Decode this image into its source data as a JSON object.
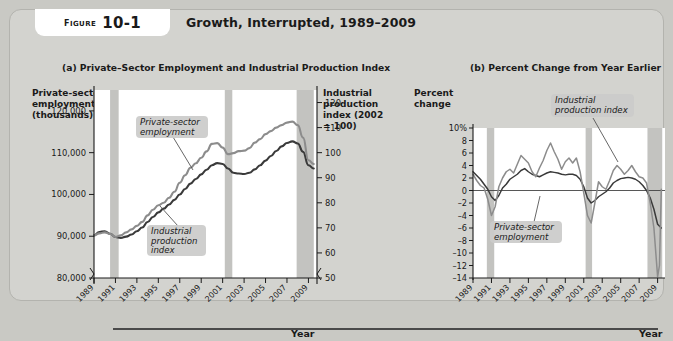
{
  "figure": {
    "label_word": "FIGURE",
    "number": "10-1",
    "title": "Growth, Interrupted, 1989–2009"
  },
  "colors": {
    "card_bg": "#d3d3cf",
    "page_bg": "#c9c9c4",
    "plot_bg": "#ffffff",
    "recession_band": "#c3c3c0",
    "employment_series": "#3a3a3a",
    "industrial_series": "#8c8c8c"
  },
  "panel_a": {
    "title": "(a) Private–Sector Employment and Industrial Production Index",
    "y_left_title": "Private-sector\nemployment\n(thousands)",
    "y_left_title_lines": [
      "Private-sector",
      "employment",
      "(thousands)"
    ],
    "y_right_title_lines": [
      "Industrial",
      "production",
      "index (2002",
      "= 100)"
    ],
    "x_title": "Year",
    "callouts": [
      {
        "name": "private-sector-employment",
        "lines": [
          "Private-sector",
          "employment"
        ]
      },
      {
        "name": "industrial-production-index",
        "lines": [
          "Industrial",
          "production",
          "index"
        ]
      }
    ]
  },
  "panel_b": {
    "title": "(b) Percent Change from Year Earlier",
    "y_title_lines": [
      "Percent",
      "change"
    ],
    "x_title": "Year",
    "callouts": [
      {
        "name": "industrial-production-index",
        "lines": [
          "Industrial",
          "production index"
        ]
      },
      {
        "name": "private-sector-employment",
        "lines": [
          "Private-sector",
          "employment"
        ]
      }
    ]
  },
  "chart_data": [
    {
      "type": "line",
      "name": "panel-a",
      "title": "(a) Private–Sector Employment and Industrial Production Index",
      "xlabel": "Year",
      "ylabel": "Private-sector employment (thousands)",
      "ylabel_right": "Industrial production index (2002 = 100)",
      "xlim": [
        1989,
        2009.8
      ],
      "ylim": [
        80000,
        125000
      ],
      "ylim_right": [
        50,
        125
      ],
      "grid": false,
      "axis_break_left": true,
      "axis_break_right": true,
      "yticks": [
        80000,
        90000,
        100000,
        110000,
        120000
      ],
      "ytick_labels": [
        "80,000",
        "90,000",
        "100,000",
        "110,000",
        "120,000"
      ],
      "yticks_right": [
        50,
        60,
        70,
        80,
        90,
        100,
        110,
        120
      ],
      "ytick_labels_right": [
        "50",
        "60",
        "70",
        "80",
        "90",
        "100",
        "110",
        "120"
      ],
      "xticks": [
        1989,
        1991,
        1993,
        1995,
        1997,
        1999,
        2001,
        2003,
        2005,
        2007,
        2009
      ],
      "xtick_labels": [
        "1989",
        "1991",
        "1993",
        "1995",
        "1997",
        "1999",
        "2001",
        "2003",
        "2005",
        "2007",
        "2009"
      ],
      "recessions": [
        [
          1990.5,
          1991.3
        ],
        [
          2001.2,
          2001.9
        ],
        [
          2007.9,
          2009.5
        ]
      ],
      "series": [
        {
          "name": "Private-sector employment",
          "axis": "left",
          "color": "#3a3a3a",
          "x": [
            1989.0,
            1989.5,
            1990.0,
            1990.5,
            1991.0,
            1991.5,
            1992.0,
            1992.5,
            1993.0,
            1993.5,
            1994.0,
            1994.5,
            1995.0,
            1995.5,
            1996.0,
            1996.5,
            1997.0,
            1997.5,
            1998.0,
            1998.5,
            1999.0,
            1999.5,
            2000.0,
            2000.5,
            2001.0,
            2001.5,
            2002.0,
            2002.5,
            2003.0,
            2003.5,
            2004.0,
            2004.5,
            2005.0,
            2005.5,
            2006.0,
            2006.5,
            2007.0,
            2007.5,
            2008.0,
            2008.5,
            2009.0,
            2009.5
          ],
          "values": [
            90200,
            91000,
            91200,
            90600,
            89800,
            89600,
            89900,
            90400,
            91200,
            92100,
            93400,
            94600,
            95700,
            96600,
            97600,
            98700,
            100000,
            101300,
            102600,
            103700,
            104800,
            105900,
            107000,
            107500,
            107300,
            106200,
            105200,
            105000,
            104900,
            105200,
            106000,
            107000,
            108100,
            109200,
            110400,
            111500,
            112300,
            112700,
            112200,
            110200,
            107000,
            106200
          ]
        },
        {
          "name": "Industrial production index",
          "axis": "right",
          "color": "#8c8c8c",
          "x": [
            1989.0,
            1989.5,
            1990.0,
            1990.5,
            1991.0,
            1991.5,
            1992.0,
            1992.5,
            1993.0,
            1993.5,
            1994.0,
            1994.5,
            1995.0,
            1995.5,
            1996.0,
            1996.5,
            1997.0,
            1997.5,
            1998.0,
            1998.5,
            1999.0,
            1999.5,
            2000.0,
            2000.5,
            2001.0,
            2001.5,
            2002.0,
            2002.5,
            2003.0,
            2003.5,
            2004.0,
            2004.5,
            2005.0,
            2005.5,
            2006.0,
            2006.5,
            2007.0,
            2007.5,
            2008.0,
            2008.5,
            2009.0,
            2009.5
          ],
          "values": [
            67.0,
            67.8,
            68.2,
            67.6,
            66.4,
            67.0,
            68.2,
            69.4,
            70.8,
            72.4,
            75.0,
            77.2,
            79.0,
            80.0,
            82.0,
            84.4,
            88.0,
            91.0,
            94.0,
            95.8,
            98.0,
            100.5,
            103.5,
            103.8,
            102.0,
            99.4,
            99.8,
            100.6,
            100.8,
            101.8,
            104.0,
            105.4,
            107.4,
            108.6,
            110.0,
            111.0,
            112.0,
            112.4,
            111.0,
            106.0,
            97.0,
            95.5
          ]
        }
      ]
    },
    {
      "type": "line",
      "name": "panel-b",
      "title": "(b) Percent Change from Year Earlier",
      "xlabel": "Year",
      "ylabel": "Percent change",
      "xlim": [
        1989,
        2009.8
      ],
      "ylim": [
        -14,
        10
      ],
      "grid": false,
      "yticks": [
        -14,
        -12,
        -10,
        -8,
        -6,
        -4,
        -2,
        0,
        2,
        4,
        6,
        8,
        10
      ],
      "ytick_labels": [
        "–14",
        "–12",
        "–10",
        "–8",
        "–6",
        "–4",
        "–2",
        "0",
        "2",
        "4",
        "6",
        "8",
        "10%"
      ],
      "xticks": [
        1989,
        1991,
        1993,
        1995,
        1997,
        1999,
        2001,
        2003,
        2005,
        2007,
        2009
      ],
      "xtick_labels": [
        "1989",
        "1991",
        "1993",
        "1995",
        "1997",
        "1999",
        "2001",
        "2003",
        "2005",
        "2007",
        "2009"
      ],
      "recessions": [
        [
          1990.5,
          1991.3
        ],
        [
          2001.2,
          2001.9
        ],
        [
          2007.9,
          2009.5
        ]
      ],
      "series": [
        {
          "name": "Private-sector employment",
          "color": "#3a3a3a",
          "x": [
            1989.0,
            1989.4,
            1989.8,
            1990.2,
            1990.6,
            1991.0,
            1991.4,
            1991.8,
            1992.2,
            1992.6,
            1993.0,
            1993.4,
            1993.8,
            1994.2,
            1994.6,
            1995.0,
            1995.4,
            1995.8,
            1996.2,
            1996.6,
            1997.0,
            1997.4,
            1997.8,
            1998.2,
            1998.6,
            1999.0,
            1999.4,
            1999.8,
            2000.2,
            2000.6,
            2001.0,
            2001.4,
            2001.8,
            2002.2,
            2002.6,
            2003.0,
            2003.4,
            2003.8,
            2004.2,
            2004.6,
            2005.0,
            2005.4,
            2005.8,
            2006.2,
            2006.6,
            2007.0,
            2007.4,
            2007.8,
            2008.2,
            2008.6,
            2009.0,
            2009.4
          ],
          "values": [
            3.0,
            2.4,
            1.8,
            1.0,
            0.2,
            -1.0,
            -1.6,
            -0.8,
            0.4,
            1.0,
            1.8,
            2.2,
            2.6,
            3.2,
            3.5,
            3.0,
            2.6,
            2.4,
            2.2,
            2.5,
            2.8,
            3.0,
            2.9,
            2.8,
            2.6,
            2.5,
            2.6,
            2.6,
            2.4,
            1.8,
            0.6,
            -1.2,
            -2.0,
            -1.6,
            -1.0,
            -0.6,
            -0.2,
            0.4,
            1.2,
            1.6,
            1.9,
            2.0,
            2.1,
            2.0,
            1.8,
            1.4,
            0.8,
            0.0,
            -1.2,
            -3.0,
            -5.4,
            -6.0
          ]
        },
        {
          "name": "Industrial production index",
          "color": "#8c8c8c",
          "x": [
            1989.0,
            1989.4,
            1989.8,
            1990.2,
            1990.6,
            1991.0,
            1991.4,
            1991.8,
            1992.2,
            1992.6,
            1993.0,
            1993.4,
            1993.8,
            1994.2,
            1994.6,
            1995.0,
            1995.4,
            1995.8,
            1996.2,
            1996.6,
            1997.0,
            1997.4,
            1997.8,
            1998.2,
            1998.6,
            1999.0,
            1999.4,
            1999.8,
            2000.2,
            2000.6,
            2001.0,
            2001.4,
            2001.8,
            2002.2,
            2002.6,
            2003.0,
            2003.4,
            2003.8,
            2004.2,
            2004.6,
            2005.0,
            2005.4,
            2005.8,
            2006.2,
            2006.6,
            2007.0,
            2007.4,
            2007.8,
            2008.2,
            2008.6,
            2009.0,
            2009.2,
            2009.4
          ],
          "values": [
            2.6,
            1.6,
            0.8,
            0.4,
            -1.4,
            -4.0,
            -2.6,
            0.6,
            2.0,
            3.0,
            3.4,
            2.8,
            4.2,
            5.6,
            5.0,
            4.4,
            3.0,
            2.2,
            3.6,
            4.8,
            6.4,
            7.6,
            6.2,
            5.0,
            3.4,
            4.6,
            5.2,
            4.4,
            5.2,
            3.0,
            -0.4,
            -4.0,
            -5.2,
            -2.0,
            1.4,
            0.6,
            0.2,
            1.6,
            3.2,
            4.0,
            3.4,
            2.6,
            3.2,
            4.0,
            3.0,
            2.2,
            2.0,
            1.2,
            -2.0,
            -6.0,
            -13.8,
            -12.0,
            0.2
          ]
        }
      ]
    }
  ]
}
